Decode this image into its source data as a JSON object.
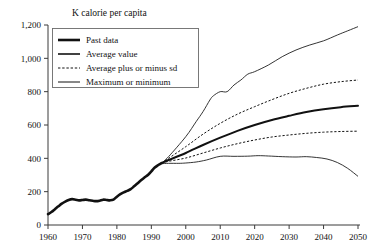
{
  "chart_data": {
    "type": "line",
    "title": "K calorie per capita",
    "xlabel": "",
    "ylabel": "",
    "xlim": [
      1960,
      2050
    ],
    "ylim": [
      0,
      1200
    ],
    "grid": false,
    "legend_position": "top-left",
    "x_ticks": [
      1960,
      1970,
      1980,
      1990,
      2000,
      2010,
      2020,
      2030,
      2040,
      2050
    ],
    "x_tick_labels": [
      "1960",
      "1970",
      "1980",
      "1990",
      "2000",
      "2010",
      "2020",
      "2030",
      "2040",
      "2050"
    ],
    "y_ticks": [
      0,
      200,
      400,
      600,
      800,
      1000,
      1200
    ],
    "y_tick_labels": [
      "0",
      "200",
      "400",
      "600",
      "800",
      "1,000",
      "1,200"
    ],
    "series": [
      {
        "name": "Past data",
        "style": "thick-solid",
        "x": [
          1960,
          1961,
          1962,
          1963,
          1964,
          1965,
          1966,
          1967,
          1968,
          1969,
          1970,
          1971,
          1972,
          1973,
          1974,
          1975,
          1976,
          1977,
          1978,
          1979,
          1980,
          1981,
          1982,
          1983,
          1984,
          1985,
          1986,
          1987,
          1988,
          1989,
          1990,
          1991,
          1992,
          1993
        ],
        "values": [
          65,
          78,
          95,
          112,
          128,
          140,
          150,
          155,
          152,
          148,
          150,
          152,
          148,
          145,
          143,
          146,
          152,
          150,
          148,
          152,
          170,
          185,
          196,
          205,
          215,
          232,
          250,
          268,
          285,
          300,
          322,
          345,
          360,
          372
        ]
      },
      {
        "name": "Average value",
        "style": "medium-solid",
        "x": [
          1993,
          1995,
          2000,
          2005,
          2010,
          2015,
          2020,
          2025,
          2030,
          2035,
          2040,
          2045,
          2050
        ],
        "values": [
          372,
          390,
          432,
          480,
          524,
          565,
          600,
          630,
          655,
          678,
          695,
          707,
          715
        ]
      },
      {
        "name": "Average plus or minus sd",
        "style": "dashed",
        "sub_series": [
          {
            "name": "Average plus sd",
            "x": [
              1993,
              1995,
              2000,
              2005,
              2010,
              2015,
              2020,
              2025,
              2030,
              2035,
              2040,
              2045,
              2050
            ],
            "values": [
              372,
              400,
              470,
              545,
              610,
              665,
              710,
              752,
              790,
              820,
              845,
              860,
              870
            ]
          },
          {
            "name": "Average minus sd",
            "x": [
              1993,
              1995,
              2000,
              2005,
              2010,
              2015,
              2020,
              2025,
              2030,
              2035,
              2040,
              2045,
              2050
            ],
            "values": [
              372,
              382,
              402,
              432,
              462,
              488,
              510,
              528,
              540,
              550,
              557,
              561,
              563
            ]
          }
        ]
      },
      {
        "name": "Maximum or minimum",
        "style": "thin-solid",
        "sub_series": [
          {
            "name": "Maximum",
            "x": [
              1993,
              1995,
              2000,
              2003,
              2005,
              2007,
              2008,
              2010,
              2012,
              2014,
              2016,
              2018,
              2020,
              2024,
              2028,
              2032,
              2036,
              2040,
              2044,
              2047,
              2050
            ],
            "values": [
              372,
              410,
              530,
              620,
              680,
              750,
              775,
              800,
              800,
              840,
              870,
              905,
              920,
              960,
              1010,
              1050,
              1080,
              1105,
              1140,
              1165,
              1190
            ]
          },
          {
            "name": "Minimum",
            "x": [
              1993,
              1995,
              1998,
              2000,
              2003,
              2006,
              2010,
              2014,
              2018,
              2021,
              2024,
              2028,
              2032,
              2035,
              2038,
              2041,
              2044,
              2047,
              2050
            ],
            "values": [
              368,
              370,
              370,
              372,
              378,
              390,
              412,
              412,
              413,
              416,
              414,
              410,
              408,
              410,
              405,
              396,
              375,
              340,
              292
            ]
          }
        ]
      }
    ],
    "legend": [
      {
        "label": "Past data",
        "style": "thick-solid"
      },
      {
        "label": "Average value",
        "style": "medium-solid"
      },
      {
        "label": "Average plus or minus sd",
        "style": "dashed"
      },
      {
        "label": "Maximum or minimum",
        "style": "thin-solid"
      }
    ]
  }
}
